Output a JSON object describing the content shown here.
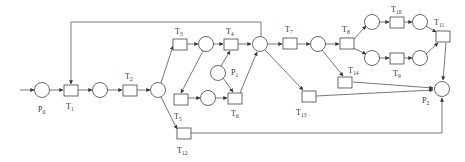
{
  "diagram": {
    "type": "petri-net",
    "stroke_color": "#444444",
    "fill_color": "#ffffff",
    "places": [
      {
        "id": "P0",
        "label_base": "P",
        "label_sub": "0",
        "cx": 42,
        "cy": 90,
        "label_x": 38,
        "label_y": 112
      },
      {
        "id": "pA",
        "cx": 100,
        "cy": 90
      },
      {
        "id": "pB",
        "cx": 158,
        "cy": 90
      },
      {
        "id": "pC",
        "cx": 206,
        "cy": 44
      },
      {
        "id": "pD",
        "cx": 260,
        "cy": 44
      },
      {
        "id": "P1",
        "label_base": "P",
        "label_sub": "1",
        "cx": 218,
        "cy": 73,
        "label_x": 231,
        "label_y": 75
      },
      {
        "id": "pE",
        "cx": 208,
        "cy": 98
      },
      {
        "id": "pF",
        "cx": 318,
        "cy": 44
      },
      {
        "id": "pG",
        "cx": 372,
        "cy": 22
      },
      {
        "id": "pH",
        "cx": 372,
        "cy": 58
      },
      {
        "id": "pI",
        "cx": 420,
        "cy": 22
      },
      {
        "id": "pJ",
        "cx": 420,
        "cy": 58
      },
      {
        "id": "P2",
        "label_base": "P",
        "label_sub": "2",
        "cx": 442,
        "cy": 89,
        "label_x": 422,
        "label_y": 103
      }
    ],
    "transitions": [
      {
        "id": "T1",
        "label_base": "T",
        "label_sub": "1",
        "x": 64,
        "y": 85,
        "label_x": 66,
        "label_y": 109
      },
      {
        "id": "T2",
        "label_base": "T",
        "label_sub": "2",
        "x": 123,
        "y": 85,
        "label_x": 125,
        "label_y": 79
      },
      {
        "id": "T3",
        "label_base": "T",
        "label_sub": "3",
        "x": 173,
        "y": 39,
        "label_x": 175,
        "label_y": 34
      },
      {
        "id": "T4",
        "label_base": "T",
        "label_sub": "4",
        "x": 224,
        "y": 39,
        "label_x": 226,
        "label_y": 34
      },
      {
        "id": "T5",
        "label_base": "T",
        "label_sub": "5",
        "x": 174,
        "y": 94,
        "label_x": 174,
        "label_y": 119
      },
      {
        "id": "T6",
        "label_base": "T",
        "label_sub": "6",
        "x": 228,
        "y": 93,
        "label_x": 231,
        "label_y": 116
      },
      {
        "id": "T7",
        "label_base": "T",
        "label_sub": "7",
        "x": 283,
        "y": 38,
        "label_x": 285,
        "label_y": 32
      },
      {
        "id": "T8",
        "label_base": "T",
        "label_sub": "8",
        "x": 340,
        "y": 38,
        "label_x": 342,
        "label_y": 32
      },
      {
        "id": "T9",
        "label_base": "T",
        "label_sub": "9",
        "x": 390,
        "y": 53,
        "label_x": 393,
        "label_y": 76
      },
      {
        "id": "T10",
        "label_base": "T",
        "label_sub": "10",
        "x": 390,
        "y": 17,
        "label_x": 391,
        "label_y": 12
      },
      {
        "id": "T11",
        "label_base": "T",
        "label_sub": "11",
        "x": 436,
        "y": 31,
        "label_x": 434,
        "label_y": 25
      },
      {
        "id": "T12",
        "label_base": "T",
        "label_sub": "12",
        "x": 177,
        "y": 128,
        "label_x": 177,
        "label_y": 153
      },
      {
        "id": "T13",
        "label_base": "T",
        "label_sub": "13",
        "x": 302,
        "y": 91,
        "label_x": 296,
        "label_y": 115
      },
      {
        "id": "T14",
        "label_base": "T",
        "label_sub": "14",
        "x": 338,
        "y": 77,
        "label_x": 348,
        "label_y": 73
      }
    ]
  }
}
